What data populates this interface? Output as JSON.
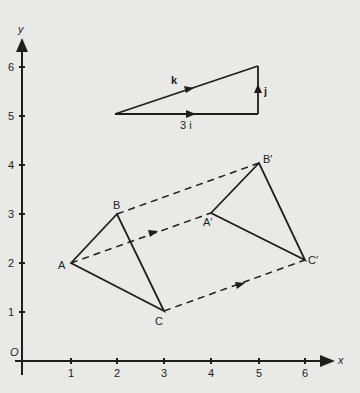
{
  "axes": {
    "x_label": "x",
    "y_label": "y",
    "origin_label": "O",
    "x_ticks": [
      "1",
      "2",
      "3",
      "4",
      "5",
      "6"
    ],
    "y_ticks": [
      "1",
      "2",
      "3",
      "4",
      "5",
      "6"
    ]
  },
  "triangle_original": {
    "A": {
      "label": "A",
      "coords": [
        1,
        2
      ]
    },
    "B": {
      "label": "B",
      "coords": [
        2,
        3
      ]
    },
    "C": {
      "label": "C",
      "coords": [
        3,
        1
      ]
    }
  },
  "triangle_image": {
    "A": {
      "label": "A′",
      "coords": [
        4,
        3
      ]
    },
    "B": {
      "label": "B′",
      "coords": [
        5,
        4
      ]
    },
    "C": {
      "label": "C′",
      "coords": [
        6,
        2
      ]
    }
  },
  "vector_triangle": {
    "k_label": "k",
    "j_label": "j",
    "i_label": "3 i",
    "start": [
      2,
      5
    ],
    "corner": [
      5,
      5
    ],
    "end": [
      5,
      6
    ]
  },
  "colors": {
    "ink": "#1e1e1e",
    "paper": "#e9e9e7"
  }
}
